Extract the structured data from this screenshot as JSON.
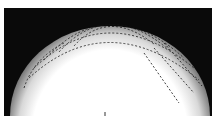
{
  "image": {
    "subject": "fingerprint impression",
    "background_color": "#0a0a0a",
    "print_color": "#ffffff",
    "mark": "L"
  }
}
